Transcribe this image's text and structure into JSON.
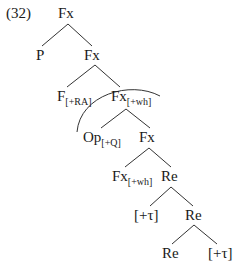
{
  "example_number": "(32)",
  "nodes": {
    "root": {
      "label": "Fx"
    },
    "p": {
      "label": "P"
    },
    "fx1": {
      "label": "Fx"
    },
    "f_ra": {
      "label": "F",
      "sub": "[+RA]"
    },
    "fx_wh1": {
      "label": "Fx",
      "sub": "[+wh]"
    },
    "op_q": {
      "label": "Op",
      "sub": "[+Q]"
    },
    "fx2": {
      "label": "Fx"
    },
    "fx_wh2": {
      "label": "Fx",
      "sub": "[+wh]"
    },
    "re1": {
      "label": "Re"
    },
    "tau1": {
      "label": "[+τ]"
    },
    "re2": {
      "label": "Re"
    },
    "re3": {
      "label": "Re"
    },
    "tau2": {
      "label": "[+τ]"
    }
  },
  "edges": [
    [
      "root",
      "p"
    ],
    [
      "root",
      "fx1"
    ],
    [
      "fx1",
      "f_ra"
    ],
    [
      "fx1",
      "fx_wh1"
    ],
    [
      "fx_wh1",
      "op_q"
    ],
    [
      "fx_wh1",
      "fx2"
    ],
    [
      "fx2",
      "fx_wh2"
    ],
    [
      "fx2",
      "re1"
    ],
    [
      "re1",
      "tau1"
    ],
    [
      "re1",
      "re2"
    ],
    [
      "re2",
      "re3"
    ],
    [
      "re2",
      "tau2"
    ]
  ],
  "annotations": {
    "arc": "curved arc from left of Op[+Q] over to right of Fx[+wh]"
  }
}
